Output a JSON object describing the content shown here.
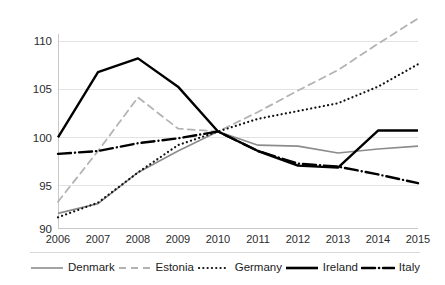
{
  "chart_data": {
    "type": "line",
    "title": "",
    "subtitle": "",
    "xlabel": "",
    "ylabel": "",
    "categories": [
      "2006",
      "2007",
      "2008",
      "2009",
      "2010",
      "2011",
      "2012",
      "2013",
      "2014",
      "2015"
    ],
    "x": [
      2006,
      2007,
      2008,
      2009,
      2010,
      2011,
      2012,
      2013,
      2014,
      2015
    ],
    "xlim": [
      2006,
      2015
    ],
    "ylim": [
      90,
      110
    ],
    "yticks": [
      90,
      95,
      100,
      105,
      110
    ],
    "grid": true,
    "legend_position": "bottom",
    "series": [
      {
        "name": "Denmark",
        "style": "solid",
        "color": "#8c8c8c",
        "values": [
          91.6,
          92.6,
          95.8,
          98.0,
          100.0,
          98.6,
          98.5,
          97.8,
          98.2,
          98.5
        ]
      },
      {
        "name": "Estonia",
        "style": "dashed",
        "color": "#b3b3b3",
        "values": [
          92.8,
          98.0,
          103.5,
          100.3,
          100.0,
          102.0,
          104.2,
          106.3,
          109.0,
          111.6
        ]
      },
      {
        "name": "Germany",
        "style": "dotted",
        "color": "#111111",
        "values": [
          91.2,
          92.7,
          95.8,
          98.6,
          100.0,
          101.3,
          102.1,
          102.9,
          104.6,
          106.9
        ]
      },
      {
        "name": "Ireland",
        "style": "solid-thick",
        "color": "#000000",
        "values": [
          99.4,
          106.1,
          107.5,
          104.6,
          100.0,
          98.0,
          96.5,
          96.3,
          100.1,
          100.1
        ]
      },
      {
        "name": "Italy",
        "style": "dash-dot",
        "color": "#000000",
        "values": [
          97.7,
          98.0,
          98.8,
          99.3,
          100.0,
          98.0,
          96.7,
          96.4,
          95.6,
          94.7
        ]
      }
    ]
  },
  "axes": {
    "y_tick_labels": [
      "110",
      "105",
      "100",
      "95",
      "90"
    ],
    "x_tick_labels": [
      "2006",
      "2007",
      "2008",
      "2009",
      "2010",
      "2011",
      "2012",
      "2013",
      "2014",
      "2015"
    ]
  },
  "legend": {
    "items": [
      {
        "label": "Denmark",
        "swatch": "line-solid-gray"
      },
      {
        "label": "Estonia",
        "swatch": "line-dashed-gray"
      },
      {
        "label": "Germany",
        "swatch": "line-dotted-black"
      },
      {
        "label": "Ireland",
        "swatch": "line-solid-black"
      },
      {
        "label": "Italy",
        "swatch": "line-dashdot-black"
      }
    ]
  },
  "colors": {
    "gray_light": "#b3b3b3",
    "gray_mid": "#8c8c8c",
    "black": "#000000",
    "gridline": "#e3e3e3",
    "axis": "#c9c9c9",
    "background": "#ffffff"
  }
}
